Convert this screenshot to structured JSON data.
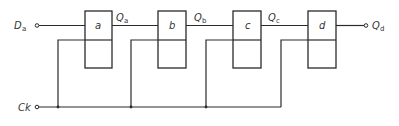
{
  "diagram": {
    "type": "shift-register",
    "inputs": {
      "data": {
        "label": "D",
        "subscript": "a"
      },
      "clock": {
        "label": "Ck"
      }
    },
    "stages": [
      {
        "id": "a",
        "label": "a",
        "output": {
          "label": "Q",
          "subscript": "a"
        }
      },
      {
        "id": "b",
        "label": "b",
        "output": {
          "label": "Q",
          "subscript": "b"
        }
      },
      {
        "id": "c",
        "label": "c",
        "output": {
          "label": "Q",
          "subscript": "c"
        }
      },
      {
        "id": "d",
        "label": "d",
        "output": {
          "label": "Q",
          "subscript": "d"
        }
      }
    ],
    "colors": {
      "line": "#2a2a2a",
      "text": "#333333",
      "background": "#ffffff"
    }
  }
}
